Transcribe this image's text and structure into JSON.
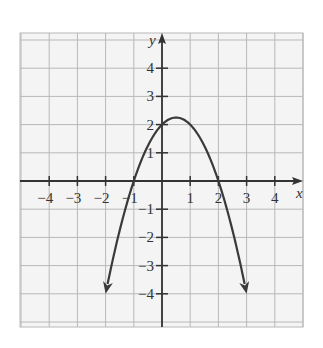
{
  "chart_data": {
    "type": "line",
    "title": "",
    "xlabel": "x",
    "ylabel": "y",
    "xlim": [
      -4.9,
      5.0
    ],
    "ylim": [
      -5.2,
      5.2
    ],
    "grid": true,
    "x_ticks": [
      -4,
      -3,
      -2,
      -1,
      1,
      2,
      3,
      4
    ],
    "y_ticks": [
      -4,
      -3,
      -2,
      -1,
      1,
      2,
      3,
      4
    ],
    "x_tick_labels": [
      "−4",
      "−3",
      "−2",
      "−1",
      "1",
      "2",
      "3",
      "4"
    ],
    "y_tick_labels": [
      "−4",
      "−3",
      "−2",
      "−1",
      "1",
      "2",
      "3",
      "4"
    ],
    "series": [
      {
        "name": "y = -x^2 + x + 2",
        "equation": "y = -x^2 + x + 2",
        "x": [
          -2,
          -1.5,
          -1,
          -0.5,
          0,
          0.5,
          1,
          1.5,
          2,
          2.5,
          3
        ],
        "y": [
          -4,
          -1.75,
          0,
          1.25,
          2,
          2.25,
          2,
          1.25,
          0,
          -1.75,
          -4
        ],
        "arrows_at_ends": true,
        "x_intercepts": [
          -1,
          2
        ],
        "y_intercept": 2,
        "vertex": [
          0.5,
          2.25
        ]
      }
    ]
  },
  "colors": {
    "grid": "#b8b8b8",
    "axis": "#333333",
    "curve": "#3a3a3a",
    "background": "#f4f4f4"
  }
}
